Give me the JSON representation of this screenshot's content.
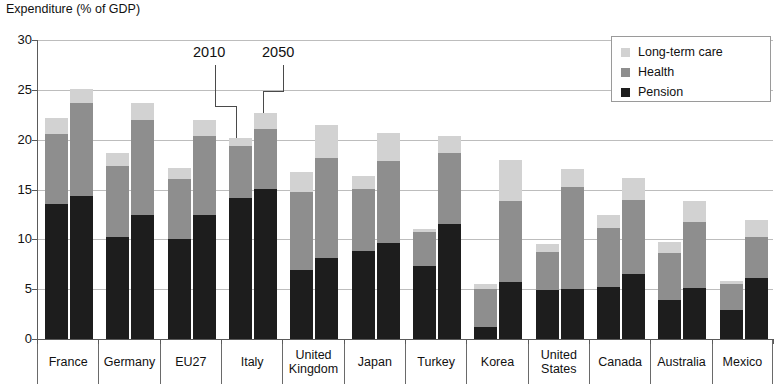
{
  "chart_data": {
    "type": "bar",
    "title": "Expenditure (% of GDP)",
    "subtitle": "",
    "xlabel": "",
    "ylabel": "Expenditure (% of GDP)",
    "ylim": [
      0,
      30
    ],
    "yticks": [
      0,
      5,
      10,
      15,
      20,
      25,
      30
    ],
    "ytick_labels": [
      "0",
      "5",
      "10",
      "15",
      "20",
      "25",
      "30"
    ],
    "grid": true,
    "stacked": true,
    "grouped": true,
    "group_labels": [
      "2010",
      "2050"
    ],
    "legend_position": "top-right",
    "legend": [
      "Long-term care",
      "Health",
      "Pension"
    ],
    "categories": [
      "France",
      "Germany",
      "EU27",
      "Italy",
      "United Kingdom",
      "Japan",
      "Turkey",
      "Korea",
      "United States",
      "Canada",
      "Australia",
      "Mexico"
    ],
    "series": [
      {
        "name": "Pension",
        "color": "#1d1d1d",
        "values_2010": [
          13.5,
          10.2,
          10.0,
          14.1,
          6.9,
          8.8,
          7.3,
          1.2,
          4.9,
          5.2,
          3.9,
          2.9
        ],
        "values_2050": [
          14.3,
          12.4,
          12.4,
          15.0,
          8.1,
          9.6,
          11.5,
          5.7,
          5.0,
          6.5,
          5.1,
          6.1
        ]
      },
      {
        "name": "Health",
        "color": "#8e8e8e",
        "values_2010": [
          7.1,
          7.2,
          6.1,
          5.3,
          7.8,
          6.3,
          3.4,
          3.8,
          3.8,
          5.9,
          4.7,
          2.6
        ],
        "values_2050": [
          9.4,
          9.6,
          8.0,
          6.1,
          10.1,
          8.3,
          7.2,
          8.1,
          10.3,
          7.4,
          6.6,
          4.1
        ]
      },
      {
        "name": "Long-term care",
        "color": "#d2d2d2",
        "values_2010": [
          1.6,
          1.3,
          1.1,
          0.8,
          2.0,
          1.3,
          0.3,
          0.5,
          0.8,
          1.3,
          1.1,
          0.3
        ],
        "values_2050": [
          1.4,
          1.7,
          1.6,
          1.6,
          3.3,
          2.8,
          1.7,
          4.1,
          1.8,
          2.2,
          2.1,
          1.7
        ]
      }
    ],
    "totals_2010": [
      22.2,
      18.7,
      17.2,
      20.2,
      16.7,
      16.4,
      11.0,
      5.5,
      9.5,
      12.4,
      9.7,
      5.8
    ],
    "totals_2050": [
      25.1,
      23.7,
      22.0,
      22.7,
      21.5,
      20.7,
      20.4,
      17.9,
      17.1,
      16.1,
      13.8,
      11.9
    ],
    "annotations": [
      {
        "text": "2010",
        "points_to": "Italy 2010 bar"
      },
      {
        "text": "2050",
        "points_to": "Italy 2050 bar"
      }
    ]
  }
}
